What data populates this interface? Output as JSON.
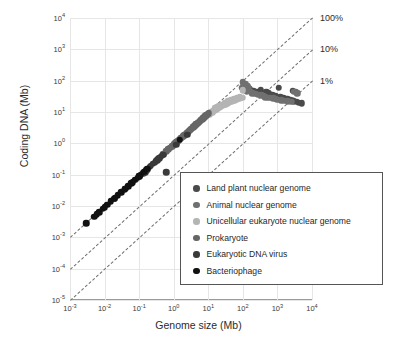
{
  "chart_data": {
    "type": "scatter",
    "title": "",
    "xlabel": "Genome size (Mb)",
    "ylabel": "Coding DNA (Mb)",
    "xscale": "log",
    "yscale": "log",
    "xlim": [
      0.001,
      10000
    ],
    "ylim": [
      1e-05,
      10000
    ],
    "grid": true,
    "legend_position": "lower-right-inside",
    "xticks": [
      {
        "value": 0.001,
        "label": "10",
        "exp": "-3"
      },
      {
        "value": 0.01,
        "label": "10",
        "exp": "-2"
      },
      {
        "value": 0.1,
        "label": "10",
        "exp": "-1"
      },
      {
        "value": 1,
        "label": "10",
        "exp": "0"
      },
      {
        "value": 10,
        "label": "10",
        "exp": "1"
      },
      {
        "value": 100,
        "label": "10",
        "exp": "2"
      },
      {
        "value": 1000,
        "label": "10",
        "exp": "3"
      },
      {
        "value": 10000,
        "label": "10",
        "exp": "4"
      }
    ],
    "yticks": [
      {
        "value": 1e-05,
        "label": "10",
        "exp": "-5"
      },
      {
        "value": 0.0001,
        "label": "10",
        "exp": "-4"
      },
      {
        "value": 0.001,
        "label": "10",
        "exp": "-3"
      },
      {
        "value": 0.01,
        "label": "10",
        "exp": "-2"
      },
      {
        "value": 0.1,
        "label": "10",
        "exp": "-1"
      },
      {
        "value": 1,
        "label": "10",
        "exp": "0"
      },
      {
        "value": 10,
        "label": "10",
        "exp": "1"
      },
      {
        "value": 100,
        "label": "10",
        "exp": "2"
      },
      {
        "value": 1000,
        "label": "10",
        "exp": "3"
      },
      {
        "value": 10000,
        "label": "10",
        "exp": "4"
      }
    ],
    "reference_lines": [
      {
        "label": "100%",
        "fraction": 1.0,
        "style": "dashed",
        "color": "#6e6e6e"
      },
      {
        "label": "10%",
        "fraction": 0.1,
        "style": "dashed",
        "color": "#6e6e6e"
      },
      {
        "label": "1%",
        "fraction": 0.01,
        "style": "dashed",
        "color": "#6e6e6e"
      }
    ],
    "series": [
      {
        "name": "Land plant nuclear genome",
        "color": "#4a4a4a",
        "size": 6.5,
        "points": [
          [
            160,
            55
          ],
          [
            200,
            48
          ],
          [
            260,
            42
          ],
          [
            330,
            52
          ],
          [
            420,
            38
          ],
          [
            480,
            45
          ],
          [
            550,
            40
          ],
          [
            700,
            36
          ],
          [
            900,
            33
          ],
          [
            1200,
            30
          ],
          [
            1500,
            28
          ],
          [
            1900,
            26
          ],
          [
            2400,
            24
          ],
          [
            3000,
            22
          ],
          [
            3600,
            21
          ],
          [
            4200,
            20
          ],
          [
            5000,
            19
          ],
          [
            2800,
            48
          ],
          [
            3400,
            44
          ],
          [
            1100,
            60
          ]
        ]
      },
      {
        "name": "Animal nuclear genome",
        "color": "#707070",
        "size": 6.5,
        "points": [
          [
            95,
            60
          ],
          [
            110,
            52
          ],
          [
            130,
            46
          ],
          [
            150,
            58
          ],
          [
            170,
            44
          ],
          [
            190,
            40
          ],
          [
            230,
            38
          ],
          [
            280,
            36
          ],
          [
            340,
            34
          ],
          [
            400,
            33
          ],
          [
            450,
            30
          ],
          [
            520,
            29
          ],
          [
            620,
            28
          ],
          [
            760,
            27
          ],
          [
            880,
            26
          ],
          [
            1000,
            25
          ],
          [
            1300,
            24
          ],
          [
            1600,
            23
          ],
          [
            2000,
            22
          ],
          [
            2500,
            21
          ],
          [
            3100,
            45
          ],
          [
            3800,
            40
          ],
          [
            100,
            90
          ],
          [
            120,
            78
          ],
          [
            140,
            70
          ]
        ]
      },
      {
        "name": "Unicellular eukaryote nuclear genome",
        "color": "#b4b4b4",
        "size": 6.5,
        "points": [
          [
            9,
            7.5
          ],
          [
            11,
            8.6
          ],
          [
            13,
            9.5
          ],
          [
            15,
            11
          ],
          [
            17,
            12
          ],
          [
            19,
            13
          ],
          [
            21,
            14
          ],
          [
            23,
            15
          ],
          [
            26,
            16
          ],
          [
            29,
            17
          ],
          [
            32,
            18
          ],
          [
            35,
            19
          ],
          [
            39,
            20
          ],
          [
            43,
            21
          ],
          [
            48,
            22
          ],
          [
            53,
            23
          ],
          [
            58,
            24
          ],
          [
            64,
            25
          ],
          [
            71,
            26
          ],
          [
            78,
            27
          ],
          [
            86,
            28
          ],
          [
            95,
            29
          ],
          [
            12,
            10
          ],
          [
            16,
            13
          ],
          [
            20,
            15
          ],
          [
            25,
            17
          ],
          [
            30,
            20
          ],
          [
            36,
            22
          ],
          [
            44,
            24
          ],
          [
            54,
            26
          ],
          [
            66,
            28
          ],
          [
            80,
            30
          ],
          [
            100,
            50
          ],
          [
            14,
            11
          ],
          [
            18,
            14
          ],
          [
            24,
            16
          ],
          [
            33,
            19
          ],
          [
            46,
            23
          ],
          [
            60,
            25
          ],
          [
            75,
            28
          ]
        ]
      },
      {
        "name": "Prokaryote",
        "color": "#666666",
        "size": 6.5,
        "points": [
          [
            0.6,
            0.55
          ],
          [
            0.7,
            0.64
          ],
          [
            0.8,
            0.73
          ],
          [
            0.9,
            0.82
          ],
          [
            1.0,
            0.9
          ],
          [
            1.1,
            1.0
          ],
          [
            1.2,
            1.08
          ],
          [
            1.3,
            1.18
          ],
          [
            1.4,
            1.26
          ],
          [
            1.5,
            1.35
          ],
          [
            1.6,
            1.45
          ],
          [
            1.7,
            1.53
          ],
          [
            1.8,
            1.62
          ],
          [
            1.9,
            1.71
          ],
          [
            2.0,
            1.8
          ],
          [
            2.2,
            1.98
          ],
          [
            2.4,
            2.16
          ],
          [
            2.6,
            2.34
          ],
          [
            2.8,
            2.52
          ],
          [
            3.0,
            2.7
          ],
          [
            3.3,
            2.97
          ],
          [
            3.6,
            3.24
          ],
          [
            3.9,
            3.5
          ],
          [
            4.2,
            3.78
          ],
          [
            4.5,
            4.05
          ],
          [
            4.9,
            4.4
          ],
          [
            5.3,
            4.7
          ],
          [
            5.7,
            5.1
          ],
          [
            6.1,
            5.5
          ],
          [
            6.6,
            5.9
          ],
          [
            7.1,
            6.4
          ],
          [
            7.6,
            6.8
          ],
          [
            8.2,
            7.3
          ],
          [
            8.8,
            7.9
          ],
          [
            9.5,
            8.5
          ],
          [
            10.2,
            9.1
          ],
          [
            1.05,
            0.95
          ],
          [
            1.35,
            1.2
          ],
          [
            1.65,
            1.5
          ],
          [
            2.1,
            1.9
          ],
          [
            2.5,
            2.2
          ],
          [
            3.1,
            2.8
          ],
          [
            3.7,
            3.3
          ],
          [
            4.4,
            4.0
          ],
          [
            5.1,
            4.6
          ],
          [
            6.0,
            5.4
          ],
          [
            7.0,
            6.3
          ],
          [
            8.0,
            7.2
          ],
          [
            9.0,
            8.1
          ],
          [
            0.5,
            0.45
          ]
        ]
      },
      {
        "name": "Eukaryotic DNA virus",
        "color": "#3a3a3a",
        "size": 6.5,
        "points": [
          [
            0.1,
            0.09
          ],
          [
            0.13,
            0.11
          ],
          [
            0.16,
            0.14
          ],
          [
            0.2,
            0.18
          ],
          [
            0.25,
            0.22
          ],
          [
            0.3,
            0.27
          ],
          [
            0.36,
            0.32
          ],
          [
            0.42,
            0.38
          ],
          [
            0.5,
            0.44
          ],
          [
            0.15,
            0.12
          ],
          [
            0.22,
            0.19
          ],
          [
            0.28,
            0.24
          ],
          [
            0.33,
            0.29
          ],
          [
            0.45,
            0.4
          ],
          [
            1.2,
            0.9
          ],
          [
            2.5,
            1.9
          ],
          [
            0.6,
            0.12
          ],
          [
            0.18,
            0.15
          ],
          [
            0.38,
            0.34
          ],
          [
            0.08,
            0.07
          ]
        ]
      },
      {
        "name": "Bacteriophage",
        "color": "#111111",
        "size": 6.5,
        "points": [
          [
            0.003,
            0.0028
          ],
          [
            0.005,
            0.0046
          ],
          [
            0.007,
            0.0064
          ],
          [
            0.009,
            0.0082
          ],
          [
            0.012,
            0.011
          ],
          [
            0.015,
            0.014
          ],
          [
            0.019,
            0.017
          ],
          [
            0.024,
            0.022
          ],
          [
            0.03,
            0.027
          ],
          [
            0.038,
            0.034
          ],
          [
            0.048,
            0.043
          ],
          [
            0.06,
            0.054
          ],
          [
            0.075,
            0.068
          ],
          [
            0.09,
            0.081
          ],
          [
            0.11,
            0.1
          ],
          [
            0.14,
            0.126
          ],
          [
            0.17,
            0.153
          ],
          [
            0.006,
            0.0055
          ],
          [
            0.01,
            0.009
          ],
          [
            0.02,
            0.018
          ],
          [
            0.04,
            0.036
          ],
          [
            0.065,
            0.058
          ],
          [
            0.1,
            0.09
          ],
          [
            1.5,
            1.3
          ]
        ]
      }
    ]
  },
  "legend": {
    "items": [
      {
        "label": "Land plant nuclear genome",
        "color": "#4a4a4a"
      },
      {
        "label": "Animal nuclear genome",
        "color": "#707070"
      },
      {
        "label": "Unicellular eukaryote nuclear genome",
        "color": "#b4b4b4"
      },
      {
        "label": "Prokaryote",
        "color": "#666666"
      },
      {
        "label": "Eukaryotic DNA virus",
        "color": "#3a3a3a"
      },
      {
        "label": "Bacteriophage",
        "color": "#111111"
      }
    ]
  }
}
